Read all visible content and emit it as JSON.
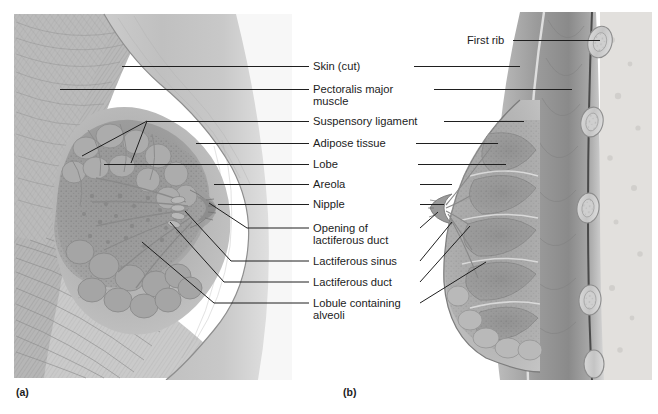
{
  "figure": {
    "background_color": "#ffffff",
    "ink_color": "#1f1f1f",
    "illustration_style": "grayscale pencil anatomical rendering"
  },
  "panels": [
    {
      "id": "a",
      "label": "(a)",
      "x": 16,
      "y": 396,
      "view": "anterior sectional view of breast with pectoralis major"
    },
    {
      "id": "b",
      "label": "(b)",
      "x": 343,
      "y": 396,
      "view": "sagittal section of breast and chest wall showing ribs"
    }
  ],
  "labels_left": [
    {
      "key": "skin_cut",
      "text": "Skin (cut)",
      "x": 313,
      "y": 70,
      "rule_y": 66,
      "rule_x1": 292,
      "rule_x2": 309
    },
    {
      "key": "pectoralis_major",
      "text": "Pectoralis major",
      "text2": "muscle",
      "x": 313,
      "y": 93,
      "y2": 105,
      "rule_y": 89,
      "rule_x1": 292,
      "rule_x2": 309
    },
    {
      "key": "suspensory_ligament",
      "text": "Suspensory ligament",
      "x": 313,
      "y": 125,
      "rule_y": 121,
      "rule_x1": 292,
      "rule_x2": 309
    },
    {
      "key": "adipose_tissue",
      "text": "Adipose tissue",
      "x": 313,
      "y": 147,
      "rule_y": 143,
      "rule_x1": 292,
      "rule_x2": 309
    },
    {
      "key": "lobe",
      "text": "Lobe",
      "x": 313,
      "y": 168,
      "rule_y": 164,
      "rule_x1": 292,
      "rule_x2": 309
    },
    {
      "key": "areola",
      "text": "Areola",
      "x": 313,
      "y": 188,
      "rule_y": 184,
      "rule_x1": 292,
      "rule_x2": 309
    },
    {
      "key": "nipple",
      "text": "Nipple",
      "x": 313,
      "y": 208,
      "rule_y": 204,
      "rule_x1": 292,
      "rule_x2": 309
    },
    {
      "key": "opening_lactiferous_duct",
      "text": "Opening of",
      "text2": "lactiferous duct",
      "x": 313,
      "y": 232,
      "y2": 244,
      "rule_y": 228,
      "rule_x1": 292,
      "rule_x2": 309
    },
    {
      "key": "lactiferous_sinus",
      "text": "Lactiferous sinus",
      "x": 313,
      "y": 265,
      "rule_y": 261,
      "rule_x1": 292,
      "rule_x2": 309
    },
    {
      "key": "lactiferous_duct",
      "text": "Lactiferous duct",
      "x": 313,
      "y": 286,
      "rule_y": 282,
      "rule_x1": 292,
      "rule_x2": 309
    },
    {
      "key": "lobule_alveoli",
      "text": "Lobule containing",
      "text2": "alveoli",
      "x": 313,
      "y": 307,
      "y2": 319,
      "rule_y": 303,
      "rule_x1": 292,
      "rule_x2": 309
    }
  ],
  "labels_right": [
    {
      "key": "first_rib",
      "text": "First rib",
      "x": 467,
      "y": 44,
      "rule_y": 40,
      "rule_x1": 513,
      "rule_x2": 600
    }
  ]
}
